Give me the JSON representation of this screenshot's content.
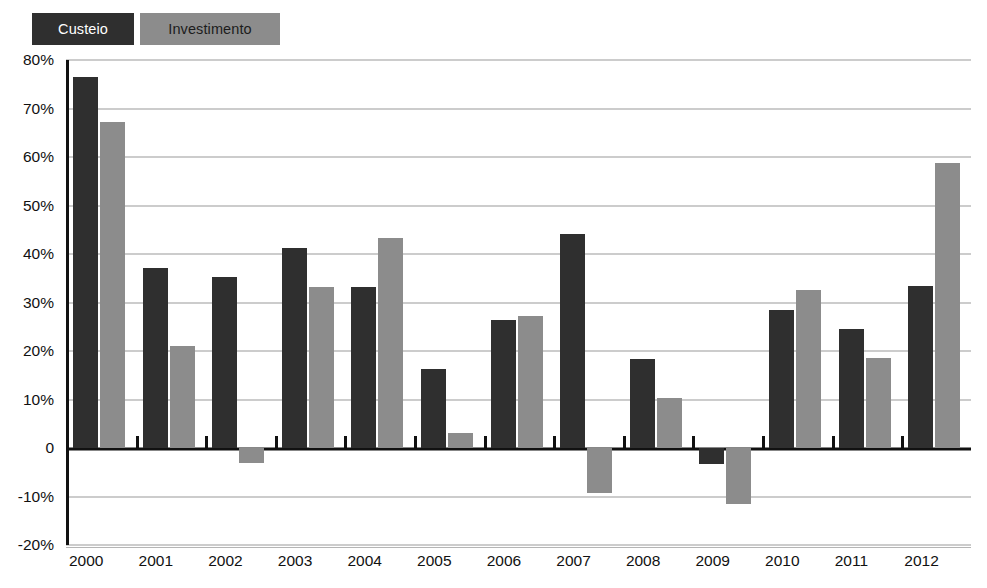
{
  "legend": {
    "position": "top-left",
    "entries": [
      {
        "label": "Custeio",
        "color": "#2f2f2f",
        "text_color": "#ffffff"
      },
      {
        "label": "Investimento",
        "color": "#8c8c8c",
        "text_color": "#1c1c1c"
      }
    ]
  },
  "axis": {
    "y_tick_labels": [
      "80%",
      "70%",
      "60%",
      "50%",
      "40%",
      "30%",
      "20%",
      "10%",
      "0",
      "-10%",
      "-20%"
    ],
    "y_tick_values": [
      80,
      70,
      60,
      50,
      40,
      30,
      20,
      10,
      0,
      -10,
      -20
    ]
  },
  "chart_data": {
    "type": "bar",
    "title": "",
    "subtitle": "",
    "xlabel": "",
    "ylabel": "",
    "ylim": [
      -20,
      80
    ],
    "ytick_step": 10,
    "ytick_format": "percent",
    "grid": true,
    "legend_position": "top-left",
    "categories": [
      "2000",
      "2001",
      "2002",
      "2003",
      "2004",
      "2005",
      "2006",
      "2007",
      "2008",
      "2009",
      "2010",
      "2011",
      "2012"
    ],
    "series": [
      {
        "name": "Custeio",
        "color": "#2f2f2f",
        "values": [
          76.5,
          37.2,
          35.2,
          41.2,
          33.2,
          16.2,
          26.3,
          44.2,
          18.3,
          -3.3,
          28.5,
          24.5,
          33.5
        ]
      },
      {
        "name": "Investimento",
        "color": "#8c8c8c",
        "values": [
          67.2,
          21.0,
          -3.1,
          33.1,
          43.2,
          3.0,
          27.2,
          -9.2,
          10.3,
          -11.6,
          32.5,
          18.5,
          58.7
        ]
      }
    ],
    "annotations": []
  }
}
